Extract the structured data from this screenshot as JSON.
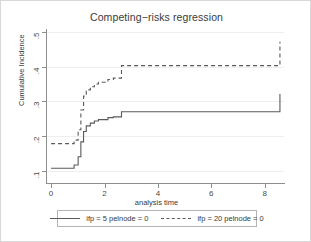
{
  "chart_data": {
    "type": "line",
    "title": "Competing−risks regression",
    "xlabel": "analysis time",
    "ylabel": "Cumulative Incidence",
    "xlim": [
      -0.15,
      8.6
    ],
    "ylim": [
      0.085,
      0.515
    ],
    "xticks": [
      0,
      2,
      4,
      6,
      8
    ],
    "xticklabels": [
      "0",
      "2",
      "4",
      "6",
      "8"
    ],
    "yticks": [
      0.1,
      0.2,
      0.3,
      0.4,
      0.5
    ],
    "yticklabels": [
      ".1",
      ".2",
      ".3",
      ".4",
      ".5"
    ],
    "grid": "horizontal",
    "legend_position": "below",
    "step_style": "post",
    "series": [
      {
        "name": "ifp = 5 pelnode = 0",
        "style": "solid",
        "color": "#5a5a5a",
        "x": [
          0.0,
          0.75,
          0.85,
          1.0,
          1.1,
          1.2,
          1.3,
          1.45,
          1.6,
          1.75,
          1.95,
          2.1,
          2.3,
          2.5,
          2.6,
          7.1,
          8.45
        ],
        "y": [
          0.122,
          0.122,
          0.131,
          0.155,
          0.198,
          0.228,
          0.244,
          0.252,
          0.258,
          0.262,
          0.262,
          0.268,
          0.27,
          0.27,
          0.285,
          0.285,
          0.336
        ]
      },
      {
        "name": "ifp = 20 pelnode = 0",
        "style": "dashed",
        "color": "#5a5a5a",
        "x": [
          0.0,
          0.75,
          0.85,
          1.0,
          1.1,
          1.2,
          1.3,
          1.45,
          1.6,
          1.75,
          1.95,
          2.1,
          2.3,
          2.5,
          2.6,
          7.1,
          8.45
        ],
        "y": [
          0.193,
          0.193,
          0.203,
          0.233,
          0.29,
          0.33,
          0.348,
          0.357,
          0.365,
          0.37,
          0.37,
          0.378,
          0.382,
          0.382,
          0.418,
          0.418,
          0.487
        ]
      }
    ]
  },
  "legend": {
    "entries": [
      {
        "label": "ifp = 5 pelnode = 0",
        "style": "solid"
      },
      {
        "label": "ifp = 20 pelnode = 0",
        "style": "dashed"
      }
    ]
  }
}
